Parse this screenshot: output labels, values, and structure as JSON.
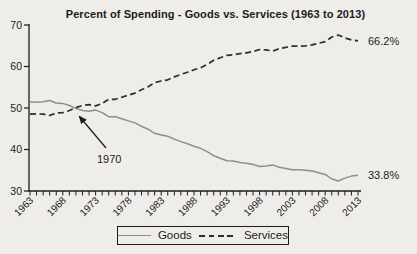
{
  "chart_data": {
    "type": "line",
    "title": "Percent of Spending - Goods vs. Services (1963 to 2013)",
    "xlabel": "",
    "ylabel": "",
    "ylim": [
      30,
      70
    ],
    "y_ticks": [
      30,
      40,
      50,
      60,
      70
    ],
    "x_ticks": [
      1963,
      1968,
      1973,
      1978,
      1983,
      1988,
      1993,
      1998,
      2003,
      2008,
      2013
    ],
    "grid": false,
    "x": [
      1963,
      1964,
      1965,
      1966,
      1967,
      1968,
      1969,
      1970,
      1971,
      1972,
      1973,
      1974,
      1975,
      1976,
      1977,
      1978,
      1979,
      1980,
      1981,
      1982,
      1983,
      1984,
      1985,
      1986,
      1987,
      1988,
      1989,
      1990,
      1991,
      1992,
      1993,
      1994,
      1995,
      1996,
      1997,
      1998,
      1999,
      2000,
      2001,
      2002,
      2003,
      2004,
      2005,
      2006,
      2007,
      2008,
      2009,
      2010,
      2011,
      2012,
      2013
    ],
    "series": [
      {
        "name": "Goods",
        "style": "solid",
        "color": "#8e8e8e",
        "end_label": "33.8%",
        "values": [
          51.5,
          51.4,
          51.5,
          51.8,
          51.2,
          51.1,
          50.6,
          49.9,
          49.4,
          49.2,
          49.5,
          48.9,
          47.9,
          47.9,
          47.4,
          46.9,
          46.4,
          45.6,
          44.9,
          43.9,
          43.5,
          43.2,
          42.5,
          41.9,
          41.4,
          40.8,
          40.3,
          39.5,
          38.5,
          37.9,
          37.3,
          37.2,
          36.9,
          36.7,
          36.4,
          35.9,
          36.0,
          36.3,
          35.7,
          35.4,
          35.1,
          35.1,
          35.0,
          34.8,
          34.4,
          34.0,
          32.9,
          32.4,
          33.1,
          33.6,
          33.8
        ]
      },
      {
        "name": "Services",
        "style": "dashed",
        "color": "#2d2d2d",
        "end_label": "66.2%",
        "values": [
          48.5,
          48.6,
          48.5,
          48.2,
          48.8,
          48.9,
          49.4,
          50.1,
          50.6,
          50.8,
          50.5,
          51.1,
          52.1,
          52.1,
          52.6,
          53.1,
          53.6,
          54.4,
          55.1,
          56.1,
          56.5,
          56.8,
          57.5,
          58.1,
          58.6,
          59.2,
          59.7,
          60.5,
          61.5,
          62.1,
          62.7,
          62.8,
          63.1,
          63.3,
          63.6,
          64.1,
          64.0,
          63.7,
          64.3,
          64.6,
          64.9,
          64.9,
          65.0,
          65.2,
          65.6,
          66.0,
          67.1,
          67.6,
          66.9,
          66.4,
          66.2
        ]
      }
    ],
    "annotation": {
      "label": "1970",
      "target_year": 1970,
      "target_value": 50
    },
    "legend": {
      "position": "bottom",
      "entries": [
        {
          "label": "Goods"
        },
        {
          "label": "Services"
        }
      ]
    }
  },
  "colors": {
    "background": "#efede9",
    "axis": "#1c1c1c",
    "text": "#1c1c1c",
    "goods_line": "#8e8e8e",
    "services_line": "#2d2d2d"
  }
}
